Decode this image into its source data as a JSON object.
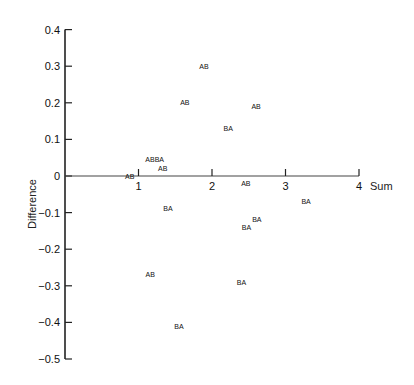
{
  "chart_data": {
    "type": "scatter",
    "title": "",
    "xlabel": "Sum",
    "ylabel": "Difference",
    "xlim": [
      0,
      4
    ],
    "ylim": [
      -0.5,
      0.4
    ],
    "x_ticks": [
      1,
      2,
      3,
      4
    ],
    "x_tick_labels": [
      "1",
      "2",
      "3",
      "4"
    ],
    "y_ticks": [
      0.4,
      0.3,
      0.2,
      0.1,
      0,
      -0.1,
      -0.2,
      -0.3,
      -0.4,
      -0.5
    ],
    "y_tick_labels": [
      "0.4",
      "0.3",
      "0.2",
      "0.1",
      "0",
      "−0.1",
      "−0.2",
      "−0.3",
      "−0.4",
      "−0.5"
    ],
    "grid": false,
    "legend": null,
    "marker": "text labels (AB / BA)",
    "series": [
      {
        "name": "AB",
        "points": [
          {
            "x": 1.89,
            "y": 0.3
          },
          {
            "x": 1.63,
            "y": 0.2
          },
          {
            "x": 2.6,
            "y": 0.19
          },
          {
            "x": 1.15,
            "y": 0.045
          },
          {
            "x": 1.33,
            "y": 0.02
          },
          {
            "x": 0.88,
            "y": 0.0
          },
          {
            "x": 2.46,
            "y": -0.02
          },
          {
            "x": 1.16,
            "y": -0.27
          }
        ]
      },
      {
        "name": "BA",
        "points": [
          {
            "x": 2.22,
            "y": 0.13
          },
          {
            "x": 1.28,
            "y": 0.045
          },
          {
            "x": 1.4,
            "y": -0.09
          },
          {
            "x": 3.28,
            "y": -0.07
          },
          {
            "x": 2.61,
            "y": -0.12
          },
          {
            "x": 2.47,
            "y": -0.14
          },
          {
            "x": 2.4,
            "y": -0.29
          },
          {
            "x": 1.55,
            "y": -0.41
          }
        ]
      }
    ],
    "annotations": [
      {
        "text": "ABBA",
        "x": 1.22,
        "y": 0.045,
        "note": "overlapping AB and BA labels"
      }
    ]
  }
}
